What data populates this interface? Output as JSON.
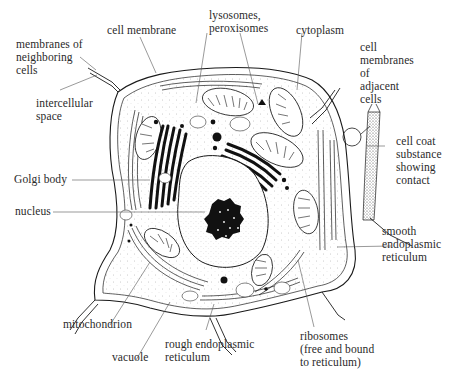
{
  "diagram": {
    "colors": {
      "ink": "#1a1a1a",
      "label": "#2a2a2a",
      "leader": "#555555",
      "background": "#ffffff"
    },
    "labels": {
      "cell_membrane": "cell membrane",
      "lysosomes": "lysosomes,\nperoxisomes",
      "cytoplasm": "cytoplasm",
      "neighbor_membranes": "membranes of\nneighboring\ncells",
      "intercellular_space": "intercellular\nspace",
      "adjacent_membranes": "cell\nmembranes\nof\nadjacent\ncells",
      "cell_coat": "cell coat\nsubstance\nshowing\ncontact",
      "golgi": "Golgi body",
      "nucleus": "nucleus",
      "smooth_er": "smooth\nendoplasmic\nreticulum",
      "mitochondrion": "mitochondrion",
      "vacuole": "vacuole",
      "rough_er": "rough endoplasmic\nreticulum",
      "ribosomes": "ribosomes\n(free and bound\nto reticulum)"
    }
  }
}
